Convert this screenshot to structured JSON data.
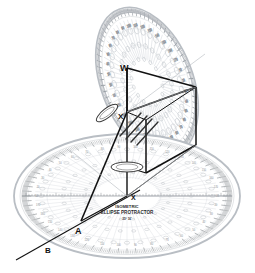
{
  "figure": {
    "background_color": "#ffffff",
    "ink_color": "#111111",
    "template_color": "#9aa0a6",
    "scale_color": "#7b8085"
  },
  "protractors": [
    {
      "id": "horizontal-protractor",
      "brand_line_1": "ISOMETRIC",
      "brand_line_2": "ELLIPSE PROTRACTOR",
      "brand_line_3": "35° 16'",
      "orientation": "horizontal",
      "center_label": "X",
      "ruler_scale_visible": true,
      "degree_ticks": 180,
      "degree_labels": [
        "10",
        "20",
        "30",
        "40",
        "50",
        "60",
        "70",
        "80",
        "90",
        "100",
        "110",
        "120",
        "130",
        "140",
        "150",
        "160",
        "170"
      ]
    },
    {
      "id": "tilted-protractor",
      "orientation": "tilted-vertical",
      "center_label": "W",
      "degree_ticks": 180,
      "degree_labels": [
        "10",
        "20",
        "30",
        "40",
        "50",
        "60",
        "70",
        "80",
        "90",
        "100",
        "110",
        "120",
        "130",
        "140",
        "150",
        "160",
        "170"
      ]
    }
  ],
  "labels": [
    {
      "key": "W",
      "text": "W",
      "role": "top-vertex-label"
    },
    {
      "key": "X",
      "text": "X",
      "role": "upper-origin-label"
    },
    {
      "key": "X2",
      "text": "X",
      "role": "lower-origin-label"
    },
    {
      "key": "A",
      "text": "A",
      "role": "lower-left-vertex-label"
    },
    {
      "key": "B",
      "text": "B",
      "role": "extension-end-label"
    }
  ],
  "geometry": {
    "box_name": "isometric-box-wireframe",
    "axis_lines": [
      "W-X vertical axis",
      "X-A construction line",
      "A-B extension line"
    ],
    "ellipse_markers": 3
  }
}
